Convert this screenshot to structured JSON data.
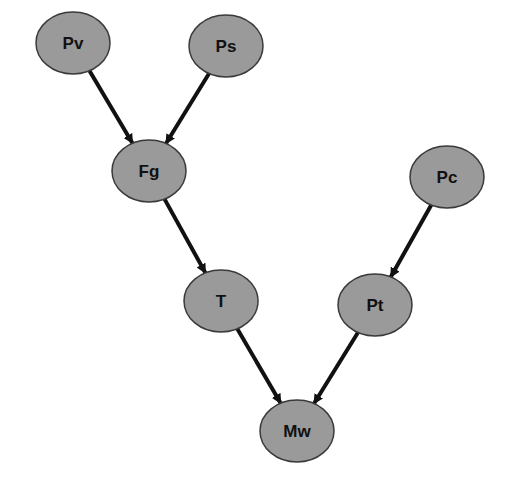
{
  "diagram": {
    "type": "directed-graph",
    "colors": {
      "node_fill": "#9a9a9a",
      "node_stroke": "#3a3a3a",
      "edge": "#111111",
      "label": "#111111",
      "background": "#ffffff"
    },
    "nodes": [
      {
        "id": "Pv",
        "label": "Pv",
        "cx": 73,
        "cy": 43,
        "rx": 37,
        "ry": 31
      },
      {
        "id": "Ps",
        "label": "Ps",
        "cx": 226,
        "cy": 46,
        "rx": 37,
        "ry": 31
      },
      {
        "id": "Fg",
        "label": "Fg",
        "cx": 149,
        "cy": 171,
        "rx": 37,
        "ry": 31
      },
      {
        "id": "Pc",
        "label": "Pc",
        "cx": 447,
        "cy": 177,
        "rx": 37,
        "ry": 31
      },
      {
        "id": "T",
        "label": "T",
        "cx": 221,
        "cy": 301,
        "rx": 37,
        "ry": 31
      },
      {
        "id": "Pt",
        "label": "Pt",
        "cx": 375,
        "cy": 305,
        "rx": 37,
        "ry": 31
      },
      {
        "id": "Mw",
        "label": "Mw",
        "cx": 297,
        "cy": 431,
        "rx": 37,
        "ry": 31
      }
    ],
    "edges": [
      {
        "from": "Pv",
        "to": "Fg"
      },
      {
        "from": "Ps",
        "to": "Fg"
      },
      {
        "from": "Fg",
        "to": "T"
      },
      {
        "from": "Pc",
        "to": "Pt"
      },
      {
        "from": "T",
        "to": "Mw"
      },
      {
        "from": "Pt",
        "to": "Mw"
      }
    ]
  }
}
